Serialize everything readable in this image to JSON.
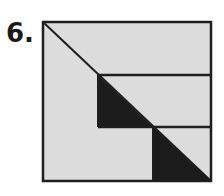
{
  "figure": {
    "label": "6.",
    "colors": {
      "fill": "#dcdcdc",
      "shade": "#1c1c1c",
      "stroke": "#1e1e1e",
      "background": "#ffffff"
    },
    "square": {
      "x": 43,
      "y": 22,
      "size": 168
    },
    "lines": [
      {
        "name": "diagonal",
        "x1": 43,
        "y1": 22,
        "x2": 211,
        "y2": 181
      },
      {
        "name": "upper-horizontal",
        "x1": 98,
        "y1": 75,
        "x2": 211,
        "y2": 75
      },
      {
        "name": "lower-horizontal",
        "x1": 98,
        "y1": 127,
        "x2": 211,
        "y2": 127
      },
      {
        "name": "upper-vertical",
        "x1": 98,
        "y1": 75,
        "x2": 98,
        "y2": 127
      },
      {
        "name": "lower-vertical",
        "x1": 153,
        "y1": 127,
        "x2": 153,
        "y2": 181
      }
    ],
    "shaded_triangles": [
      {
        "name": "upper-triangle",
        "points": "98,75 98,127 153,127"
      },
      {
        "name": "lower-triangle",
        "points": "153,127 153,181 211,181"
      }
    ]
  }
}
